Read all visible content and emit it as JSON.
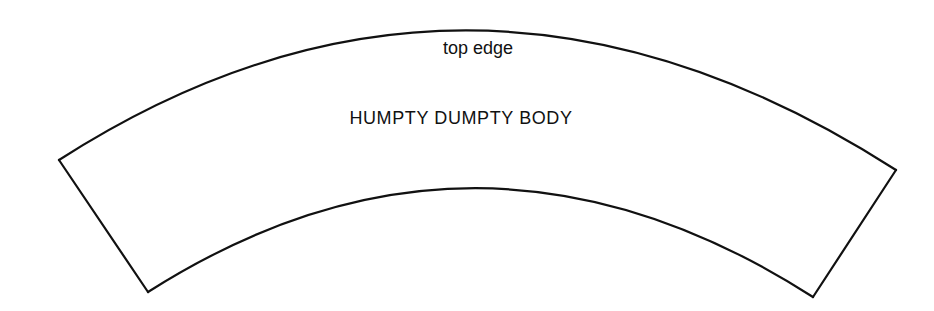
{
  "diagram": {
    "type": "pattern-template",
    "shape": "annular-sector",
    "stroke_color": "#111111",
    "background": "#ffffff",
    "labels": {
      "top_edge": "top edge",
      "body": "HUMPTY DUMPTY BODY"
    },
    "outline": {
      "outer_arc": {
        "start": [
          59,
          160
        ],
        "apex": [
          470,
          28
        ],
        "end": [
          896,
          170
        ]
      },
      "inner_arc": {
        "start": [
          148,
          292
        ],
        "apex": [
          470,
          189
        ],
        "end": [
          813,
          297
        ]
      }
    }
  }
}
